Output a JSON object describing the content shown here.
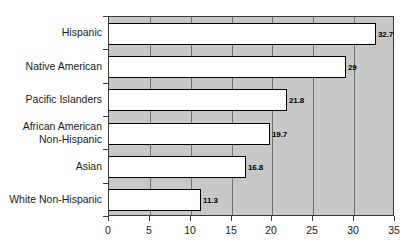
{
  "chart_data": {
    "type": "bar",
    "orientation": "horizontal",
    "title": "",
    "subtitle": "",
    "xlabel": "",
    "ylabel": "",
    "categories": [
      "Hispanic",
      "Native American",
      "Pacific Islanders",
      "African American\nNon-Hispanic",
      "Asian",
      "White Non-Hispanic"
    ],
    "category_lines": [
      [
        "Hispanic"
      ],
      [
        "Native American"
      ],
      [
        "Pacific Islanders"
      ],
      [
        "African American",
        "Non-Hispanic"
      ],
      [
        "Asian"
      ],
      [
        "White Non-Hispanic"
      ]
    ],
    "values": [
      32.7,
      29,
      21.8,
      19.7,
      16.8,
      11.3
    ],
    "value_labels": [
      "32.7",
      "29",
      "21.8",
      "19.7",
      "16.8",
      "11.3"
    ],
    "xlim": [
      0,
      35
    ],
    "xticks": [
      0,
      5,
      10,
      15,
      20,
      25,
      30,
      35
    ],
    "xtick_labels": [
      "0",
      "5",
      "10",
      "15",
      "20",
      "25",
      "30",
      "35"
    ],
    "grid": true,
    "grid_axis": "x",
    "legend": false,
    "legend_position": "none",
    "colors": {
      "plot_background": "#c8c8c8",
      "bar_fill": "#ffffff",
      "bar_edge": "#000000",
      "gridline": "#6f6f6f",
      "axis": "#3a3a3a",
      "text": "#1a1a1a",
      "value_label": "#000000",
      "page_background": "#ffffff"
    }
  }
}
